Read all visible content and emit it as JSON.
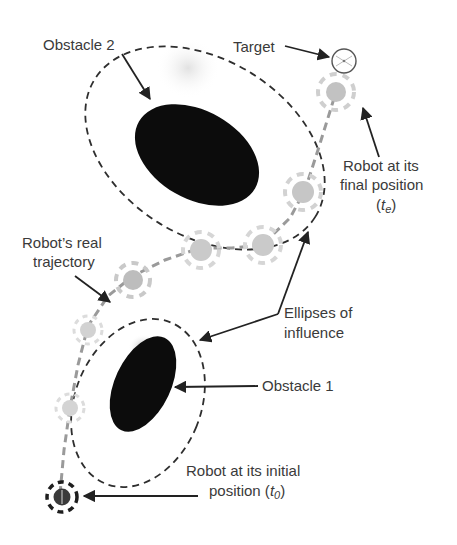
{
  "diagram": {
    "type": "robot-navigation-obstacle-avoidance",
    "colors": {
      "background": "#ffffff",
      "obstacle": "#0c0c0c",
      "ellipse_stroke": "#2e2e2e",
      "trajectory": "#9a9a9a",
      "robot_ghost": "#c8c8c8",
      "robot_initial": "#2a2a2a",
      "label_text": "#3a3a3a",
      "arrow": "#222222"
    },
    "labels": {
      "obstacle2": "Obstacle 2",
      "target": "Target",
      "robot_final_line1": "Robot at its",
      "robot_final_line2": "final position",
      "robot_final_line3_open": "(",
      "robot_final_var": "t",
      "robot_final_sub": "e",
      "robot_final_line3_close": ")",
      "trajectory_line1": "Robot’s real",
      "trajectory_line2": "trajectory",
      "ellipses_line1": "Ellipses of",
      "ellipses_line2": "influence",
      "obstacle1": "Obstacle 1",
      "robot_initial_line1": "Robot at its initial",
      "robot_initial_line2_prefix": "position (",
      "robot_initial_var": "t",
      "robot_initial_sub": "0",
      "robot_initial_line2_suffix": ")"
    },
    "nodes": [
      {
        "id": "obstacle-2",
        "kind": "obstacle",
        "label": "Obstacle 2"
      },
      {
        "id": "obstacle-1",
        "kind": "obstacle",
        "label": "Obstacle 1"
      },
      {
        "id": "ellipse-influence-2",
        "kind": "ellipse-of-influence"
      },
      {
        "id": "ellipse-influence-1",
        "kind": "ellipse-of-influence"
      },
      {
        "id": "target",
        "kind": "target",
        "label": "Target"
      },
      {
        "id": "robot-initial",
        "kind": "robot",
        "label": "Robot at its initial position (t0)"
      },
      {
        "id": "robot-final",
        "kind": "robot",
        "label": "Robot at its final position (te)"
      }
    ],
    "robot_path_points": [
      [
        60,
        494
      ],
      [
        70,
        408
      ],
      [
        88,
        326
      ],
      [
        133,
        276
      ],
      [
        200,
        248
      ],
      [
        262,
        245
      ],
      [
        305,
        190
      ],
      [
        336,
        92
      ]
    ]
  }
}
